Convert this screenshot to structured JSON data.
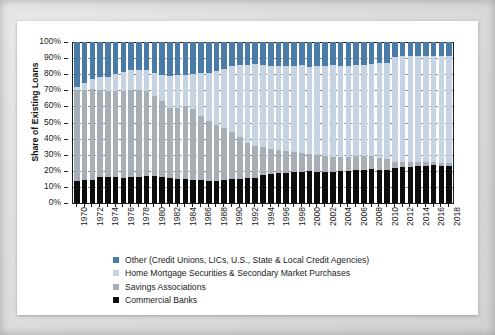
{
  "chart_data": {
    "type": "bar",
    "stacked": true,
    "title": "",
    "xlabel": "",
    "ylabel": "Share of Existing Loans",
    "ylim": [
      0,
      100
    ],
    "ytick_labels": [
      "100%",
      "90%",
      "80%",
      "70%",
      "60%",
      "50%",
      "40%",
      "30%",
      "20%",
      "10%",
      "0%"
    ],
    "ytick_values": [
      100,
      90,
      80,
      70,
      60,
      50,
      40,
      30,
      20,
      10,
      0
    ],
    "grid": true,
    "legend_position": "bottom-left",
    "x": [
      1970,
      1971,
      1972,
      1973,
      1974,
      1975,
      1976,
      1977,
      1978,
      1979,
      1980,
      1981,
      1982,
      1983,
      1984,
      1985,
      1986,
      1987,
      1988,
      1989,
      1990,
      1991,
      1992,
      1993,
      1994,
      1995,
      1996,
      1997,
      1998,
      1999,
      2000,
      2001,
      2002,
      2003,
      2004,
      2005,
      2006,
      2007,
      2008,
      2009,
      2010,
      2011,
      2012,
      2013,
      2014,
      2015,
      2016,
      2017,
      2018
    ],
    "xtick_labels": [
      "1970",
      "1972",
      "1974",
      "1976",
      "1978",
      "1980",
      "1982",
      "1984",
      "1986",
      "1988",
      "1990",
      "1992",
      "1994",
      "1996",
      "1998",
      "2000",
      "2002",
      "2004",
      "2006",
      "2008",
      "2010",
      "2012",
      "2014",
      "2016",
      "2018"
    ],
    "categories": [
      1970,
      1971,
      1972,
      1973,
      1974,
      1975,
      1976,
      1977,
      1978,
      1979,
      1980,
      1981,
      1982,
      1983,
      1984,
      1985,
      1986,
      1987,
      1988,
      1989,
      1990,
      1991,
      1992,
      1993,
      1994,
      1995,
      1996,
      1997,
      1998,
      1999,
      2000,
      2001,
      2002,
      2003,
      2004,
      2005,
      2006,
      2007,
      2008,
      2009,
      2010,
      2011,
      2012,
      2013,
      2014,
      2015,
      2016,
      2017,
      2018
    ],
    "series": [
      {
        "name": "Commercial Banks",
        "color": "#0d0d0d",
        "values": [
          13.5,
          14.0,
          14.5,
          16.0,
          16.3,
          16.0,
          15.8,
          16.0,
          16.3,
          16.8,
          16.6,
          16.0,
          15.3,
          14.8,
          15.0,
          14.6,
          14.0,
          13.5,
          13.4,
          14.0,
          15.0,
          15.2,
          15.4,
          15.8,
          17.5,
          18.2,
          18.6,
          18.8,
          19.0,
          19.2,
          19.6,
          19.5,
          19.4,
          19.2,
          19.6,
          20.0,
          20.4,
          20.6,
          21.2,
          20.8,
          20.4,
          21.6,
          22.4,
          22.6,
          22.8,
          23.0,
          23.4,
          23.2,
          23.0
        ]
      },
      {
        "name": "Savings Associations",
        "color": "#a8aeb5",
        "values": [
          56.5,
          56.0,
          56.5,
          54.5,
          53.2,
          53.5,
          54.0,
          54.5,
          54.0,
          52.8,
          50.0,
          47.5,
          44.0,
          44.5,
          45.0,
          44.0,
          40.0,
          37.5,
          35.0,
          32.5,
          29.0,
          25.5,
          22.0,
          19.5,
          17.0,
          15.5,
          14.5,
          13.5,
          12.5,
          11.8,
          11.0,
          10.4,
          9.8,
          9.4,
          9.0,
          8.8,
          8.6,
          8.4,
          8.0,
          7.4,
          6.8,
          4.0,
          3.2,
          2.8,
          2.6,
          2.4,
          2.0,
          1.8,
          1.6
        ]
      },
      {
        "name": "Home Mortgage Securities & Secondary Market Purchases",
        "color": "#c5d3e2",
        "values": [
          2.0,
          4.5,
          6.0,
          7.5,
          9.0,
          10.5,
          11.5,
          12.0,
          12.5,
          13.0,
          14.0,
          16.0,
          19.5,
          20.0,
          19.5,
          21.5,
          26.5,
          30.0,
          33.5,
          37.0,
          41.0,
          45.0,
          48.5,
          51.0,
          51.0,
          51.5,
          52.0,
          52.5,
          53.5,
          54.5,
          54.0,
          55.0,
          56.0,
          57.0,
          56.5,
          56.5,
          56.5,
          57.0,
          57.0,
          58.5,
          60.0,
          65.0,
          65.5,
          65.8,
          65.8,
          65.8,
          66.0,
          66.2,
          66.6
        ]
      },
      {
        "name": "Other (Credit Unions, LICs, U.S., State & Local Credit Agencies)",
        "color": "#4a7ba7",
        "values": [
          28.0,
          25.5,
          23.0,
          22.0,
          21.5,
          20.0,
          18.7,
          17.5,
          17.2,
          17.4,
          19.4,
          20.5,
          21.2,
          20.7,
          20.5,
          19.9,
          19.5,
          19.0,
          18.1,
          16.5,
          15.0,
          14.3,
          14.1,
          13.7,
          14.5,
          14.8,
          14.9,
          15.2,
          15.0,
          14.5,
          15.4,
          15.1,
          14.8,
          14.4,
          14.9,
          14.7,
          14.5,
          14.0,
          13.8,
          13.3,
          12.8,
          9.4,
          8.9,
          8.8,
          8.8,
          8.8,
          8.6,
          8.8,
          8.8
        ]
      }
    ],
    "legend": [
      {
        "label": "Other (Credit Unions, LICs, U.S., State & Local Credit Agencies)",
        "color": "#4a7ba7"
      },
      {
        "label": "Home Mortgage Securities & Secondary Market Purchases",
        "color": "#c5d3e2"
      },
      {
        "label": "Savings Associations",
        "color": "#a8aeb5"
      },
      {
        "label": "Commercial Banks",
        "color": "#0d0d0d"
      }
    ]
  }
}
